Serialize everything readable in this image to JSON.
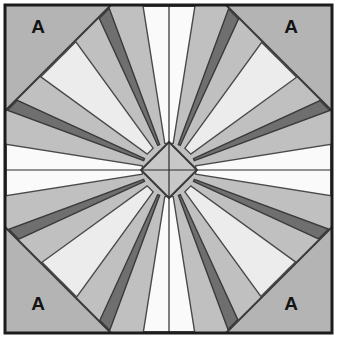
{
  "figure": {
    "kind": "mariners-compass-quilt-block",
    "canvas": {
      "width": 338,
      "height": 339
    }
  },
  "frame": {
    "name": "block-border",
    "x": 5,
    "y": 5,
    "width": 327,
    "height": 328,
    "stroke_color": "#1c1c1c",
    "stroke_width": 3,
    "background_color": "#b4b4b4"
  },
  "octagon": {
    "name": "octagon-outline",
    "corner_cut": 106,
    "fill_color": "#c0c0c0",
    "stroke_color": "#3a3a3a",
    "stroke_width": 2
  },
  "center_diamond": {
    "name": "center-diamond",
    "cx": 169,
    "cy": 170,
    "radius": 28,
    "fill_color": "#c8c8c8",
    "stroke_color": "#3a3a3a",
    "stroke_width": 2
  },
  "guides": {
    "vertical_x": 169,
    "horizontal_y": 170,
    "stroke_color": "#2a2a2a",
    "stroke_width": 1.2
  },
  "rays": {
    "count": 16,
    "outer_radius": 164,
    "inner_radius": 27,
    "wide_half_angle": 9.0,
    "spoke_half_angle": 2.2,
    "wedge_fill_light": "#ececec",
    "wedge_fill_pale": "#fafafa",
    "spoke_fill": "#6f6f6f",
    "spoke_stroke": "#3a3a3a",
    "wedge_stroke": "#4a4a4a",
    "start_angle": -90,
    "angles": [
      -90,
      -67.5,
      -45,
      -22.5,
      0,
      22.5,
      45,
      67.5,
      90,
      112.5,
      135,
      157.5,
      180,
      202.5,
      225,
      247.5
    ],
    "wedge_kinds": [
      "wide",
      "spoke",
      "wide",
      "spoke",
      "wide",
      "spoke",
      "wide",
      "spoke",
      "wide",
      "spoke",
      "wide",
      "spoke",
      "wide",
      "spoke",
      "wide",
      "spoke"
    ]
  },
  "corners": [
    {
      "name": "corner-a-top-left",
      "label": "A",
      "x": 38,
      "y": 33
    },
    {
      "name": "corner-a-top-right",
      "label": "A",
      "x": 291,
      "y": 33
    },
    {
      "name": "corner-a-bottom-left",
      "label": "A",
      "x": 38,
      "y": 310
    },
    {
      "name": "corner-a-bottom-right",
      "label": "A",
      "x": 291,
      "y": 310
    }
  ],
  "palette": {
    "corner_gray": "#b4b4b4",
    "ring_gray": "#c0c0c0",
    "wedge_light": "#ececec",
    "wedge_white": "#fafafa",
    "spoke_dark": "#6f6f6f",
    "line_dark": "#1c1c1c",
    "page_white": "#ffffff"
  }
}
